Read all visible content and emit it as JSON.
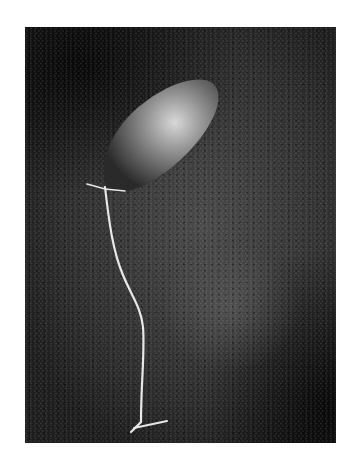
{
  "image": {
    "subject": "balloon on asphalt",
    "style": "black-and-white photograph",
    "elements": [
      {
        "name": "balloon",
        "description": "deflating elongated balloon with bright highlight"
      },
      {
        "name": "string",
        "description": "white ribbon trailing downward from balloon knot"
      },
      {
        "name": "asphalt",
        "description": "dark textured ground with lighter circular stain"
      }
    ]
  }
}
